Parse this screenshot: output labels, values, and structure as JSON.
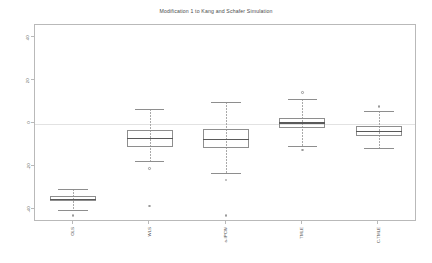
{
  "chart_data": {
    "type": "box",
    "title": "Modification 1 to Kang and Schafer Simulation",
    "xlabel": "",
    "ylabel": "",
    "ylim": [
      -46,
      46
    ],
    "yticks": [
      40,
      20,
      0,
      -20,
      -40
    ],
    "ytick_labels": [
      "40",
      "20",
      "0",
      "-20",
      "-40"
    ],
    "grid": false,
    "legend": "none",
    "zero_reference_line": 0,
    "categories": [
      "OLS",
      "WLS",
      "a-IPCW",
      "TMLE",
      "C-TMLE"
    ],
    "boxes": [
      {
        "label": "OLS",
        "whisker_low": -40.5,
        "q1": -36.4,
        "median": -35.2,
        "q3": -34.0,
        "whisker_high": -30.5,
        "outliers": [
          -43.0
        ]
      },
      {
        "label": "WLS",
        "whisker_low": -17.5,
        "q1": -11.0,
        "median": -6.8,
        "q3": -3.2,
        "whisker_high": 7.0,
        "outliers": [
          -21.0,
          -38.5
        ]
      },
      {
        "label": "a-IPCW",
        "whisker_low": -23.0,
        "q1": -11.5,
        "median": -7.2,
        "q3": -2.8,
        "whisker_high": 10.0,
        "outliers": [
          -26.5,
          -43.0
        ]
      },
      {
        "label": "TMLE",
        "whisker_low": -10.5,
        "q1": -2.0,
        "median": 0.6,
        "q3": 2.8,
        "whisker_high": 11.5,
        "outliers": [
          14.5,
          -12.5
        ]
      },
      {
        "label": "C-TMLE",
        "whisker_low": -11.5,
        "q1": -5.8,
        "median": -3.4,
        "q3": -1.2,
        "whisker_high": 6.0,
        "outliers": [
          8.0
        ]
      }
    ],
    "colors": {
      "box_border": "#8e8e8e",
      "median": "#5a5a5a",
      "whisker": "#a9a9a9",
      "frame": "#b9b9b9",
      "zero_line": "#e2e2e2",
      "text": "#4a4a4a"
    }
  }
}
